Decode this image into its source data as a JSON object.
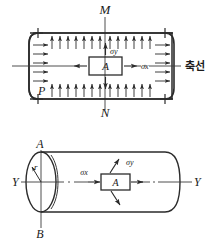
{
  "figure": {
    "title_alt": "Stress element in a pressurized cylindrical vessel",
    "colors": {
      "ink": "#2b2b2b",
      "ink_light": "#3a3a3a",
      "background": "#ffffff"
    },
    "top_diagram": {
      "name": "longitudinal-section-view",
      "labels": {
        "top_axis": "M",
        "bottom_axis": "N",
        "corner_pressure": "P",
        "axis_line_korean": "축선",
        "element": "A",
        "stress_vertical": "σy",
        "stress_horizontal": "σx"
      },
      "arrow_counts": {
        "top": 13,
        "bottom": 13,
        "left": 5,
        "right": 5
      }
    },
    "bottom_diagram": {
      "name": "cylinder-perspective-view",
      "labels": {
        "top_point": "A",
        "bottom_point": "B",
        "axis_left": "Y",
        "axis_right": "Y",
        "radius": "r",
        "element": "A",
        "stress_horizontal": "σx",
        "stress_vertical": "σy"
      }
    }
  }
}
